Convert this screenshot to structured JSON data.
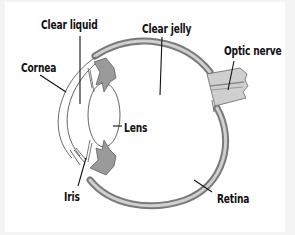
{
  "diagram": {
    "labels": {
      "clear_liquid": "Clear liquid",
      "clear_jelly": "Clear jelly",
      "optic_nerve": "Optic nerve",
      "cornea": "Cornea",
      "lens": "Lens",
      "iris": "Iris",
      "retina": "Retina"
    },
    "colors": {
      "outline": "#555555",
      "tissue_fill": "#9a9a9a",
      "sclera_fill": "#c8c8c8",
      "leader_line": "#111111",
      "background": "#ffffff"
    }
  }
}
